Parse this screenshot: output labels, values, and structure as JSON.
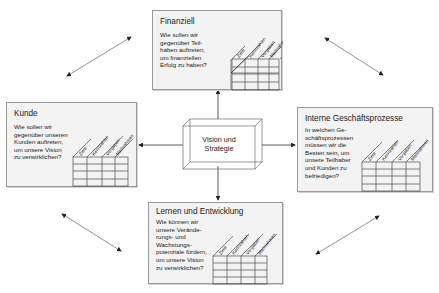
{
  "center": {
    "line1": "Vision und",
    "line2": "Strategie"
  },
  "table_columns": [
    "Ziele",
    "Kennzahlen",
    "Vorgaben",
    "Maßnahmen"
  ],
  "perspectives": [
    {
      "id": "finanziell",
      "title": "Finanziell",
      "question": "Wie sollen wir\ngegenüber Teil-\nhaben auftreten,\num finanziellen\nErfolg zu haben?"
    },
    {
      "id": "kunde",
      "title": "Kunde",
      "question": "Wie sollen wir\ngegenüber unseren\nKunden auftreten,\num unsere Vision\nzu verwirklichen?"
    },
    {
      "id": "interne",
      "title": "Interne Geschäftsprozesse",
      "question": "In welchen Ge-\nschäftsprozessen\nmüssen wir die\nBesten sein, um\nunsere Teilhaber\nund Kunden zu\nbefriedigen?"
    },
    {
      "id": "lernen",
      "title": "Lernen und Entwicklung",
      "question": "Wie können wir\nunsere Verände-\nrungs- und\nWachstungs-\npotenziale fördern,\num unsere Vision\nzu verwirklichen?"
    }
  ],
  "colors": {
    "box_fill": "#f3f3f3",
    "border": "#9a9a9a",
    "line": "#333333",
    "arrow": "#555555"
  }
}
